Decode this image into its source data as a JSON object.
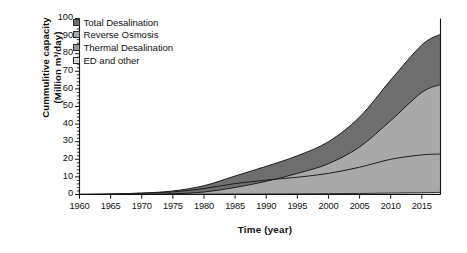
{
  "chart_data": {
    "type": "area",
    "title": "",
    "subtitle": "",
    "xlabel": "Time (year)",
    "ylabel_line1": "Cummulitive capacity",
    "ylabel_line2": "(Million m³/day)",
    "xlim": [
      1960,
      2018
    ],
    "ylim": [
      0,
      100
    ],
    "grid": false,
    "legend_position": "top-left",
    "xticks": [
      1960,
      1965,
      1970,
      1975,
      1980,
      1985,
      1990,
      1995,
      2000,
      2005,
      2010,
      2015
    ],
    "yticks": [
      0,
      10,
      20,
      30,
      40,
      50,
      60,
      70,
      80,
      90,
      100
    ],
    "y_minor_tick_step": 2,
    "legend": [
      {
        "label": "Total Desalination",
        "color": "#6e6e6e"
      },
      {
        "label": "Reverse Osmosis",
        "color": "#a9a9a9"
      },
      {
        "label": "Thermal Desalination",
        "color": "#9a9a9a"
      },
      {
        "label": "ED and other",
        "color": "#d6d6d6"
      }
    ],
    "x": [
      1960,
      1965,
      1970,
      1975,
      1980,
      1985,
      1990,
      1995,
      2000,
      2005,
      2010,
      2015,
      2018
    ],
    "series": [
      {
        "name": "Total Desalination",
        "color": "#6e6e6e",
        "values": [
          0.1,
          0.3,
          0.8,
          2.0,
          5.0,
          10.5,
          16.0,
          22.0,
          30.0,
          44.0,
          65.0,
          85.0,
          91.0
        ]
      },
      {
        "name": "Reverse Osmosis",
        "color": "#a9a9a9",
        "values": [
          0.0,
          0.0,
          0.1,
          0.4,
          1.4,
          4.0,
          7.5,
          12.0,
          17.5,
          27.0,
          42.0,
          58.0,
          62.5
        ]
      },
      {
        "name": "Thermal Desalination",
        "color": "#9a9a9a",
        "values": [
          0.1,
          0.3,
          0.7,
          1.5,
          3.4,
          6.2,
          8.2,
          9.8,
          12.0,
          15.5,
          20.0,
          22.5,
          23.0
        ]
      },
      {
        "name": "ED and other",
        "color": "#d6d6d6",
        "values": [
          0.0,
          0.0,
          0.0,
          0.1,
          0.2,
          0.3,
          0.3,
          0.4,
          0.5,
          0.6,
          0.8,
          1.0,
          1.2
        ]
      }
    ]
  }
}
